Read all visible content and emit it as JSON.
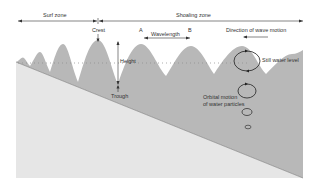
{
  "diagram": {
    "labels": {
      "surf_zone": "Surf zone",
      "shoaling_zone": "Shoaling zone",
      "crest": "Crest",
      "point_a": "A",
      "point_b": "B",
      "wavelength": "Wavelength",
      "direction": "Direction of wave motion",
      "height": "Height",
      "trough": "Trough",
      "still_water_level": "Still water level",
      "orbital_line1": "Orbital motion",
      "orbital_line2": "of water particles"
    },
    "colors": {
      "water": "#b8b8b8",
      "seabed": "#e6e6e6",
      "line": "#333333",
      "dots": "#8a8a8a"
    }
  }
}
